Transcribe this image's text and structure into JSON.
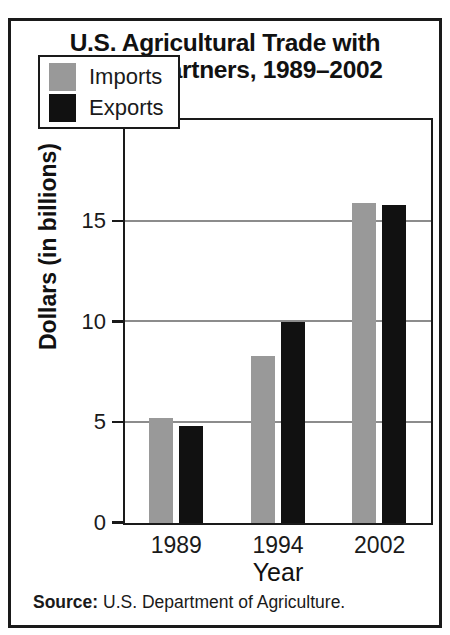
{
  "chart_data": {
    "type": "bar",
    "title": "U.S. Agricultural Trade with NAFTA Partners, 1989–2002",
    "title_lines": [
      "U.S. Agricultural Trade with",
      "NAFTA Partners, 1989–2002"
    ],
    "categories": [
      "1989",
      "1994",
      "2002"
    ],
    "series": [
      {
        "name": "Imports",
        "color": "#999999",
        "values": [
          5.2,
          8.3,
          15.9
        ]
      },
      {
        "name": "Exports",
        "color": "#111111",
        "values": [
          4.85,
          10.0,
          15.8
        ]
      }
    ],
    "xlabel": "Year",
    "ylabel": "Dollars (in billions)",
    "ylim": [
      0,
      20
    ],
    "yticks": [
      0,
      5,
      10,
      15,
      20
    ],
    "ytick_labels": [
      "0",
      "5",
      "10",
      "15",
      "20"
    ],
    "grid": "horizontal",
    "legend_position": "top-left-inside"
  },
  "source": {
    "label": "Source:",
    "text": "U.S. Department of Agriculture."
  }
}
